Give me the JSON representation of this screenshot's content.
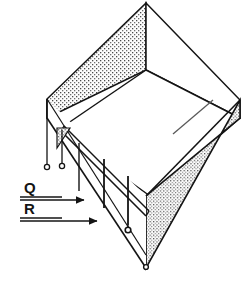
{
  "figure": {
    "kind": "isometric-technical-line-drawing",
    "background_color": "#ffffff",
    "line_color": "#141414",
    "stipple_color": "#4a4a4a",
    "stipple_fill_color": "#fdfdfd"
  },
  "callouts": [
    {
      "id": "callout-q",
      "label": "Q",
      "underline": true,
      "arrow": "right",
      "arrow_style": "solid-filled-triangle"
    },
    {
      "id": "callout-r",
      "label": "R",
      "underline": true,
      "arrow": "right",
      "arrow_style": "solid-filled-triangle"
    }
  ],
  "leader_terminators": [
    {
      "id": "terminator-1",
      "style": "open-circle"
    },
    {
      "id": "terminator-2",
      "style": "open-circle"
    },
    {
      "id": "terminator-3",
      "style": "open-circle"
    },
    {
      "id": "terminator-4",
      "style": "open-circle"
    }
  ],
  "geometry": {
    "top_vertex": [
      146,
      3
    ],
    "left_vertex": [
      47,
      99
    ],
    "right_vertex": [
      240,
      100
    ],
    "bottom_vertex": [
      146,
      268
    ],
    "inner_top_vertex": [
      146,
      70
    ]
  }
}
